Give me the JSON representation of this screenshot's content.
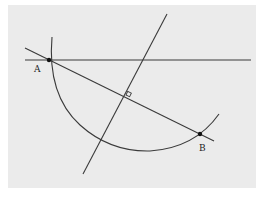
{
  "diagram": {
    "type": "geometric-construction",
    "colors": {
      "background": "#ffffff",
      "panel": "#ebebeb",
      "stroke": "#3a3a3a",
      "point": "#111111"
    },
    "points": {
      "A": {
        "label": "A",
        "x": 49,
        "y": 60
      },
      "B": {
        "label": "B",
        "x": 200,
        "y": 134
      }
    },
    "elements": [
      "horizontal line through A",
      "line through A and B",
      "perpendicular bisector of AB",
      "arc centered near right-angle crossing",
      "right-angle marker at midpoint of AB"
    ]
  }
}
